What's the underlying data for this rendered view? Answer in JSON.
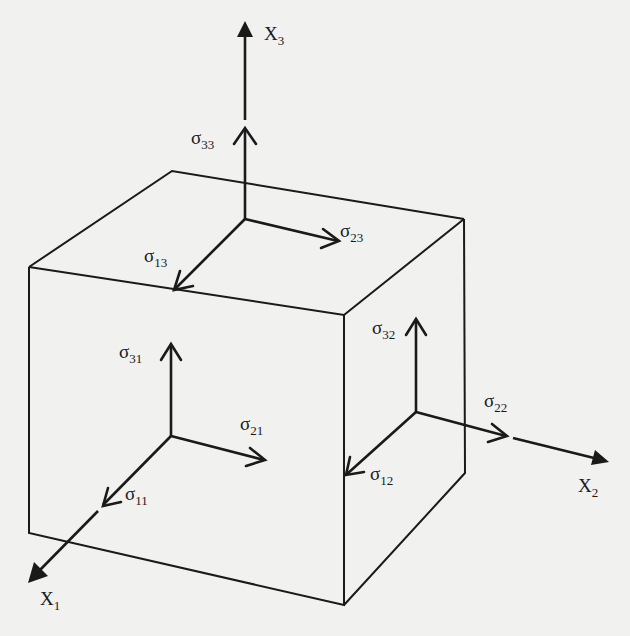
{
  "figure": {
    "axes": [
      {
        "id": "x1",
        "label": "X",
        "subscript": "1"
      },
      {
        "id": "x2",
        "label": "X",
        "subscript": "2"
      },
      {
        "id": "x3",
        "label": "X",
        "subscript": "3"
      }
    ],
    "faces": {
      "top": {
        "components": [
          {
            "id": "s33",
            "symbol": "σ",
            "subscript": "33"
          },
          {
            "id": "s23",
            "symbol": "σ",
            "subscript": "23"
          },
          {
            "id": "s13",
            "symbol": "σ",
            "subscript": "13"
          }
        ]
      },
      "front": {
        "components": [
          {
            "id": "s31",
            "symbol": "σ",
            "subscript": "31"
          },
          {
            "id": "s21",
            "symbol": "σ",
            "subscript": "21"
          },
          {
            "id": "s11",
            "symbol": "σ",
            "subscript": "11"
          }
        ]
      },
      "right": {
        "components": [
          {
            "id": "s32",
            "symbol": "σ",
            "subscript": "32"
          },
          {
            "id": "s22",
            "symbol": "σ",
            "subscript": "22"
          },
          {
            "id": "s12",
            "symbol": "σ",
            "subscript": "12"
          }
        ]
      }
    },
    "colors": {
      "line": "#1a1a1a",
      "background": "#f1f1f0"
    }
  }
}
